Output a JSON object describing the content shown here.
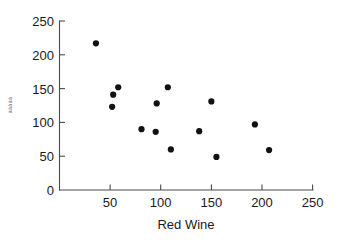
{
  "chart_data": {
    "type": "scatter",
    "title": "",
    "xlabel": "Red Wine",
    "ylabel": "ààààà",
    "xlim": [
      0,
      250
    ],
    "ylim": [
      0,
      250
    ],
    "xticks": [
      0,
      50,
      100,
      150,
      200,
      250
    ],
    "xtick_labels": [
      "0",
      "50",
      "100",
      "150",
      "200",
      "250"
    ],
    "yticks": [
      0,
      50,
      100,
      150,
      200,
      250
    ],
    "ytick_labels": [
      "0",
      "50",
      "100",
      "150",
      "200",
      "250"
    ],
    "grid": false,
    "legend": false,
    "marker": "filled-circle",
    "marker_color": "#111111",
    "points": [
      {
        "x": 36,
        "y": 217
      },
      {
        "x": 52,
        "y": 123
      },
      {
        "x": 53,
        "y": 141
      },
      {
        "x": 58,
        "y": 152
      },
      {
        "x": 81,
        "y": 90
      },
      {
        "x": 95,
        "y": 86
      },
      {
        "x": 96,
        "y": 128
      },
      {
        "x": 107,
        "y": 152
      },
      {
        "x": 110,
        "y": 60
      },
      {
        "x": 138,
        "y": 87
      },
      {
        "x": 150,
        "y": 131
      },
      {
        "x": 155,
        "y": 49
      },
      {
        "x": 193,
        "y": 97
      },
      {
        "x": 207,
        "y": 59
      }
    ],
    "point_count": 14
  },
  "axes": {
    "x_axis_name": "x-axis",
    "y_axis_name": "y-axis"
  }
}
